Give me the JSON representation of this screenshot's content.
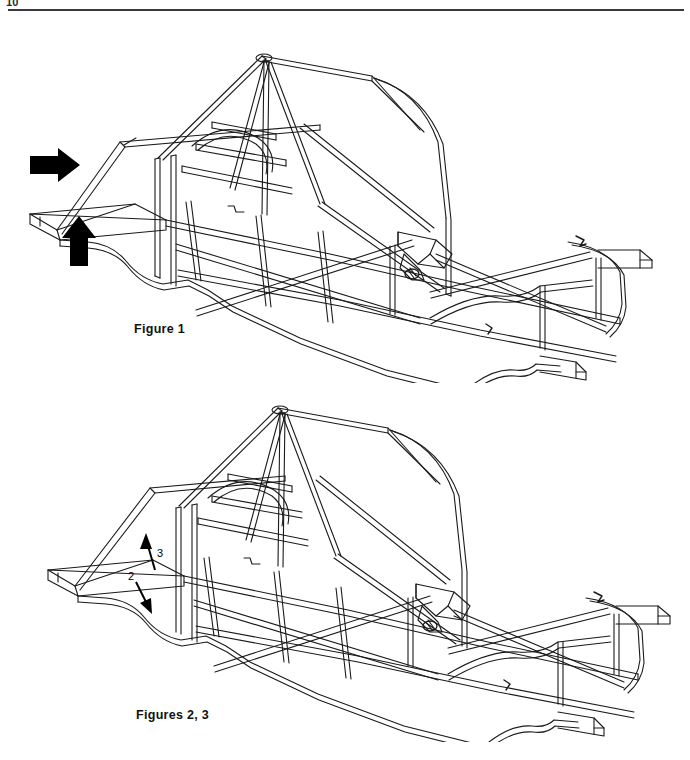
{
  "page": {
    "number": "10",
    "has_header_rule": true,
    "background_color": "#ffffff",
    "ink_color": "#000000"
  },
  "figures": [
    {
      "id": "figure-1",
      "caption": "Figure 1",
      "subject": "tubular space frame chassis, isometric view",
      "annotations": [
        {
          "name": "arrow-right",
          "kind": "solid-black-arrow",
          "direction": "right",
          "label": ""
        },
        {
          "name": "arrow-up",
          "kind": "solid-black-arrow",
          "direction": "up",
          "label": ""
        }
      ]
    },
    {
      "id": "figure-2",
      "caption": "Figures 2, 3",
      "subject": "tubular space frame chassis, isometric view",
      "annotations": [
        {
          "name": "callout-3",
          "kind": "leader-arrow",
          "direction": "up-left",
          "label": "3"
        },
        {
          "name": "callout-2",
          "kind": "leader-arrow",
          "direction": "down-left",
          "label": "2"
        }
      ]
    }
  ],
  "callouts": {
    "three": "3",
    "two": "2"
  }
}
